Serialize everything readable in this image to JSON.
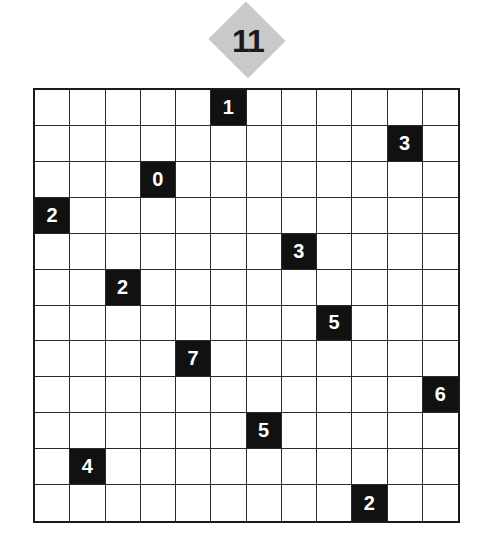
{
  "puzzle": {
    "number": "11",
    "rows": 12,
    "cols": 12,
    "colors": {
      "badge": "#c9c9c9",
      "clue_bg": "#111111",
      "clue_text": "#ffffff",
      "grid_line": "#2a2a2a"
    },
    "clues": [
      {
        "row": 0,
        "col": 5,
        "value": "1"
      },
      {
        "row": 1,
        "col": 10,
        "value": "3"
      },
      {
        "row": 2,
        "col": 3,
        "value": "0"
      },
      {
        "row": 3,
        "col": 0,
        "value": "2"
      },
      {
        "row": 4,
        "col": 7,
        "value": "3"
      },
      {
        "row": 5,
        "col": 2,
        "value": "2"
      },
      {
        "row": 6,
        "col": 8,
        "value": "5"
      },
      {
        "row": 7,
        "col": 4,
        "value": "7"
      },
      {
        "row": 8,
        "col": 11,
        "value": "6"
      },
      {
        "row": 9,
        "col": 6,
        "value": "5"
      },
      {
        "row": 10,
        "col": 1,
        "value": "4"
      },
      {
        "row": 11,
        "col": 9,
        "value": "2"
      }
    ]
  }
}
